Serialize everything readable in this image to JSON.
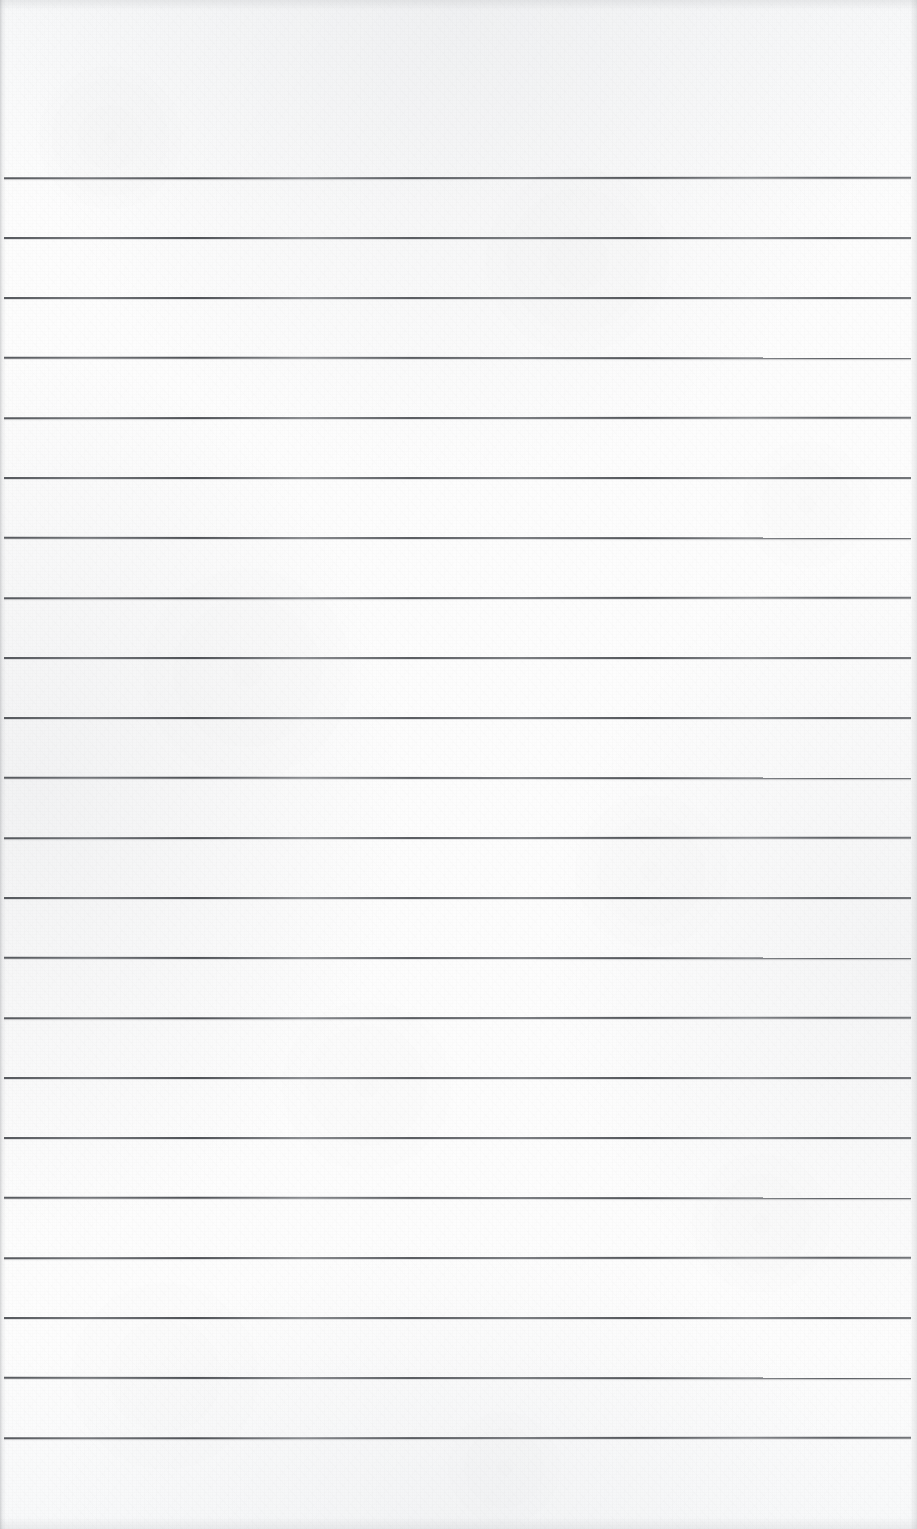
{
  "document": {
    "kind": "scanned-lined-paper",
    "title": "Blank ruled notebook page",
    "page_width": 917,
    "page_height": 1529,
    "has_text": false,
    "has_handwriting": false,
    "visible_text": ""
  },
  "paper": {
    "background_color": "#fdfdfd",
    "tint_color": "#f7f8f9",
    "edge_shadow_color": "#8c8e92",
    "texture": "fibrous scanned paper grain"
  },
  "ruling": {
    "line_color": "#4b4e53",
    "line_thickness_px": 2,
    "line_count": 22,
    "line_spacing_px": 60,
    "first_line_y": 177,
    "last_line_y": 1437,
    "line_left_x": 4,
    "line_right_x": 911,
    "top_margin_px": 177,
    "bottom_margin_px": 92,
    "left_margin_px": 4,
    "right_margin_px": 6,
    "has_vertical_margin_rule": false,
    "lines_y": [
      177,
      237,
      297,
      357,
      417,
      477,
      537,
      597,
      657,
      717,
      777,
      837,
      897,
      957,
      1017,
      1077,
      1137,
      1197,
      1257,
      1317,
      1377,
      1437
    ]
  }
}
